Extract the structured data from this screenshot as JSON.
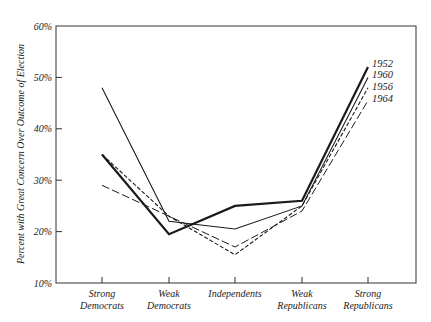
{
  "chart_data": {
    "type": "line",
    "title": "",
    "xlabel": "",
    "ylabel": "Percent with Great Concern Over Outcome of Election",
    "ylim": [
      10,
      60
    ],
    "yticks": [
      "10%",
      "20%",
      "30%",
      "40%",
      "50%",
      "60%"
    ],
    "grid": false,
    "legend_position": "inline-right",
    "categories": [
      [
        "Strong",
        "Democrats"
      ],
      [
        "Weak",
        "Democrats"
      ],
      [
        "Independents"
      ],
      [
        "Weak",
        "Republicans"
      ],
      [
        "Strong",
        "Republicans"
      ]
    ],
    "series": [
      {
        "name": "1952",
        "style": "thick-solid",
        "values": [
          35,
          19.5,
          25,
          26,
          52
        ]
      },
      {
        "name": "1960",
        "style": "thin-solid",
        "values": [
          48,
          22,
          20.5,
          25,
          50
        ]
      },
      {
        "name": "1956",
        "style": "dashed",
        "values": [
          35,
          23,
          15.5,
          25,
          48
        ]
      },
      {
        "name": "1964",
        "style": "long-dashed",
        "values": [
          29,
          23,
          17,
          24,
          45.5
        ]
      }
    ]
  }
}
